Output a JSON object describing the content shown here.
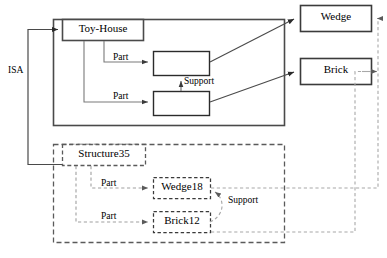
{
  "diagram": {
    "colors": {
      "stroke_solid": "#3f3f3f",
      "stroke_thin": "#6b6b6b",
      "stroke_dashed": "#9a9a9a",
      "text": "#000000",
      "background": "#ffffff"
    },
    "nodes": [
      {
        "id": "toy_house",
        "label": "Toy-House",
        "style": "solid",
        "x": 62,
        "y": 19,
        "w": 82,
        "h": 21
      },
      {
        "id": "part_slot_1",
        "label": "",
        "style": "solid",
        "x": 153,
        "y": 51,
        "w": 57,
        "h": 24
      },
      {
        "id": "part_slot_2",
        "label": "",
        "style": "solid",
        "x": 153,
        "y": 91,
        "w": 57,
        "h": 24
      },
      {
        "id": "wedge",
        "label": "Wedge",
        "style": "solid",
        "x": 300,
        "y": 5,
        "w": 72,
        "h": 26
      },
      {
        "id": "brick",
        "label": "Brick",
        "style": "solid",
        "x": 300,
        "y": 58,
        "w": 72,
        "h": 26
      },
      {
        "id": "structure35",
        "label": "Structure35",
        "style": "dashed",
        "x": 62,
        "y": 144,
        "w": 84,
        "h": 21
      },
      {
        "id": "wedge18",
        "label": "Wedge18",
        "style": "dashed",
        "x": 153,
        "y": 177,
        "w": 58,
        "h": 21
      },
      {
        "id": "brick12",
        "label": "Brick12",
        "style": "dashed",
        "x": 153,
        "y": 211,
        "w": 58,
        "h": 21
      }
    ],
    "containers": [
      {
        "id": "toy_house_frame",
        "style": "solid",
        "x": 53,
        "y": 19,
        "w": 232,
        "h": 107
      },
      {
        "id": "structure35_frame",
        "style": "dashed",
        "x": 53,
        "y": 144,
        "w": 232,
        "h": 99
      }
    ],
    "edge_labels": [
      {
        "id": "isa",
        "label": "ISA",
        "x": 8,
        "y": 66
      },
      {
        "id": "part_1",
        "label": "Part",
        "x": 113,
        "y": 54
      },
      {
        "id": "support_1",
        "label": "Support",
        "x": 182,
        "y": 78
      },
      {
        "id": "part_2",
        "label": "Part",
        "x": 113,
        "y": 90
      },
      {
        "id": "part_3",
        "label": "Part",
        "x": 100,
        "y": 178
      },
      {
        "id": "support_2",
        "label": "Support",
        "x": 214,
        "y": 196
      },
      {
        "id": "part_4",
        "label": "Part",
        "x": 100,
        "y": 209
      }
    ],
    "relations": [
      {
        "from": "structure35",
        "to": "toy_house",
        "label": "ISA",
        "style": "solid"
      },
      {
        "from": "toy_house",
        "to": "part_slot_1",
        "label": "Part",
        "style": "solid"
      },
      {
        "from": "toy_house",
        "to": "part_slot_2",
        "label": "Part",
        "style": "solid"
      },
      {
        "from": "part_slot_2",
        "to": "part_slot_1",
        "label": "Support",
        "style": "solid"
      },
      {
        "from": "part_slot_1",
        "to": "wedge",
        "label": "",
        "style": "solid"
      },
      {
        "from": "part_slot_2",
        "to": "brick",
        "label": "",
        "style": "solid"
      },
      {
        "from": "structure35",
        "to": "wedge18",
        "label": "Part",
        "style": "dashed"
      },
      {
        "from": "structure35",
        "to": "brick12",
        "label": "Part",
        "style": "dashed"
      },
      {
        "from": "wedge18",
        "to": "brick12",
        "label": "Support",
        "style": "dashed"
      },
      {
        "from": "wedge18",
        "to": "wedge",
        "label": "",
        "style": "dashed"
      },
      {
        "from": "brick12",
        "to": "brick",
        "label": "",
        "style": "dashed"
      }
    ]
  }
}
